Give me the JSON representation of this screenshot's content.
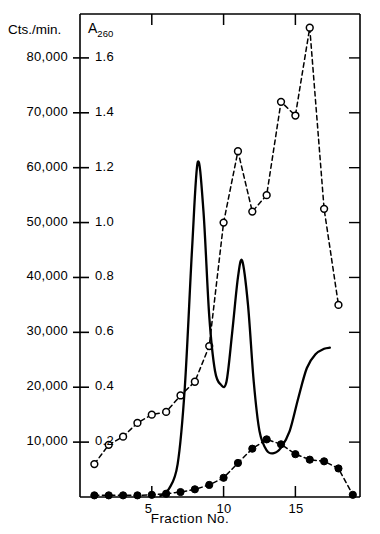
{
  "figure": {
    "axis_title_left": "Cts./min.",
    "axis_title_right_main": "A",
    "axis_title_right_sub": "260",
    "xaxis_title": "Fraction No."
  },
  "colors": {
    "ink": "#000000",
    "background": "#ffffff"
  },
  "chart_data": {
    "type": "line",
    "title": "",
    "xlabel": "Fraction No.",
    "ylabel_left": "Cts./min.",
    "ylabel_right": "A260",
    "grid": false,
    "legend": "none",
    "xlim": [
      0,
      19.5
    ],
    "x_ticks": [
      5,
      10,
      15
    ],
    "x_tick_labels": [
      "5",
      "10",
      "15"
    ],
    "ylim_left": [
      0,
      88000
    ],
    "y_ticks_left": [
      10000,
      20000,
      30000,
      40000,
      50000,
      60000,
      70000,
      80000
    ],
    "y_tick_labels_left": [
      "10,000",
      "20,000",
      "30,000",
      "40,000",
      "50,000",
      "60,000",
      "70,000",
      "80,000"
    ],
    "ylim_right": [
      0,
      1.76
    ],
    "y_ticks_right": [
      0.2,
      0.4,
      0.6,
      0.8,
      1.0,
      1.2,
      1.4,
      1.6
    ],
    "y_tick_labels_right": [
      "0.2",
      "0.4",
      "0.6",
      "0.8",
      "1.0",
      "1.2",
      "1.4",
      "1.6"
    ],
    "series": [
      {
        "name": "A260 absorbance",
        "axis": "right",
        "style": "dashed",
        "marker": "open-circle",
        "x": [
          1,
          2,
          3,
          4,
          5,
          6,
          7,
          8,
          9,
          10,
          11,
          12,
          13,
          14,
          15,
          16,
          17,
          18
        ],
        "values": [
          0.12,
          0.19,
          0.22,
          0.27,
          0.3,
          0.31,
          0.37,
          0.42,
          0.55,
          1.0,
          1.26,
          1.04,
          1.1,
          1.44,
          1.39,
          1.71,
          1.05,
          0.7
        ]
      },
      {
        "name": "Radioactivity solid trace",
        "axis": "left",
        "style": "solid",
        "marker": "none",
        "x": [
          5.6,
          6.2,
          6.8,
          7.3,
          7.8,
          8.2,
          8.6,
          9.0,
          9.4,
          9.8,
          10.2,
          10.6,
          11.0,
          11.3,
          11.7,
          12.1,
          12.5,
          13.0,
          13.5,
          14.0,
          14.6,
          15.2,
          15.8,
          16.4,
          17.0,
          17.4
        ],
        "values": [
          200,
          1500,
          6000,
          20000,
          45000,
          61000,
          52000,
          33000,
          23000,
          20500,
          21000,
          30000,
          40000,
          43000,
          35000,
          21000,
          12000,
          8500,
          8000,
          9000,
          12000,
          18000,
          23500,
          26000,
          27000,
          27200
        ]
      },
      {
        "name": "Radioactivity fraction counts",
        "axis": "left",
        "style": "dashed",
        "marker": "filled-circle",
        "x": [
          1,
          2,
          3,
          4,
          5,
          6,
          7,
          8,
          9,
          10,
          11,
          12,
          13,
          14,
          15,
          16,
          17,
          18,
          19
        ],
        "values": [
          300,
          300,
          300,
          300,
          400,
          600,
          900,
          1400,
          2200,
          3500,
          6200,
          8800,
          10500,
          9600,
          7800,
          6800,
          6500,
          5200,
          400
        ]
      }
    ]
  }
}
